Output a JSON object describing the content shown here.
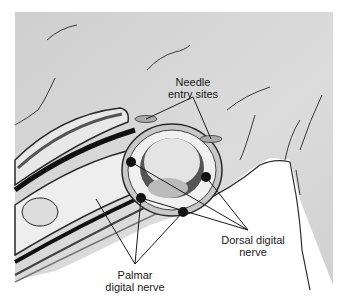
{
  "figure": {
    "labels": {
      "needle_entry": [
        "Needle",
        "entry sites"
      ],
      "dorsal_nerve": [
        "Dorsal digital",
        "nerve"
      ],
      "palmar_nerve": [
        "Palmar",
        "digital nerve"
      ]
    },
    "colors": {
      "background_skin": "#d4d4d4",
      "outline": "#2a2a2a",
      "bone_fill": "#e2e2e2",
      "nerve": "#111111",
      "tissue": "#ececec",
      "page": "#ffffff"
    }
  }
}
